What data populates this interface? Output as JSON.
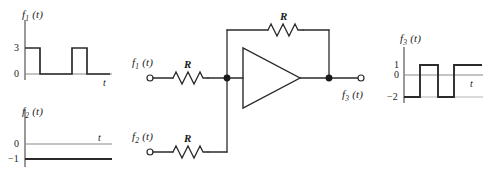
{
  "figure": {
    "kind": "op-amp-summing-amplifier-with-waveforms",
    "line_color": "#2b2b2b",
    "axis_color": "#555555",
    "text_color": "#1a1a1a"
  },
  "plots": {
    "f1": {
      "title": "f",
      "title_sub": "1",
      "title_arg": "(t)",
      "xlabel": "t",
      "ytick_labels": [
        "3",
        "0"
      ],
      "chart": {
        "type": "line",
        "title": "f_1(t)",
        "xlabel": "t",
        "ylabel": "f_1(t)",
        "ylim": [
          0,
          3.6
        ],
        "yticks": [
          0,
          3
        ],
        "x": [
          0,
          0,
          1,
          1,
          3,
          3,
          4,
          4,
          6
        ],
        "y": [
          0,
          3,
          3,
          0,
          0,
          3,
          3,
          0,
          0
        ],
        "description": "Two rectangular pulses of amplitude 3 starting at t=0 and t=3, each of width 1"
      }
    },
    "f2": {
      "title": "f",
      "title_sub": "2",
      "title_arg": "(t)",
      "xlabel": "t",
      "ytick_labels": [
        "0",
        "−1"
      ],
      "chart": {
        "type": "line",
        "title": "f_2(t)",
        "xlabel": "t",
        "ylabel": "f_2(t)",
        "ylim": [
          -1.4,
          0.6
        ],
        "yticks": [
          -1,
          0
        ],
        "x": [
          0,
          6
        ],
        "y": [
          -1,
          -1
        ],
        "description": "Constant DC level at -1"
      }
    },
    "f3": {
      "title": "f",
      "title_sub": "3",
      "title_arg": "(t)",
      "xlabel": "t",
      "ytick_labels": [
        "1",
        "0",
        "−2"
      ],
      "chart": {
        "type": "line",
        "title": "f_3(t)",
        "xlabel": "t",
        "ylabel": "f_3(t)",
        "ylim": [
          -2.6,
          1.6
        ],
        "yticks": [
          -2,
          0,
          1
        ],
        "x": [
          0,
          0,
          1,
          1,
          2,
          2,
          3,
          3,
          5
        ],
        "y": [
          -2,
          -2,
          -2,
          1,
          1,
          -2,
          -2,
          1,
          1
        ],
        "description": "Output swings between -2 and 1; equals -(f1+f2): -2 while f1=3, +1 while f1=0"
      }
    }
  },
  "circuit": {
    "input1_label": "f",
    "input1_sub": "1",
    "input1_arg": "(t)",
    "input2_label": "f",
    "input2_sub": "2",
    "input2_arg": "(t)",
    "output_label": "f",
    "output_sub": "3",
    "output_arg": "(t)",
    "resistor_input1": "R",
    "resistor_input2": "R",
    "resistor_feedback": "R",
    "amplifier": "inverting-amplifier-triangle",
    "nodes": [
      "summing-node",
      "output-node"
    ],
    "terminals": [
      "input1-terminal",
      "input2-terminal",
      "output-terminal"
    ]
  }
}
